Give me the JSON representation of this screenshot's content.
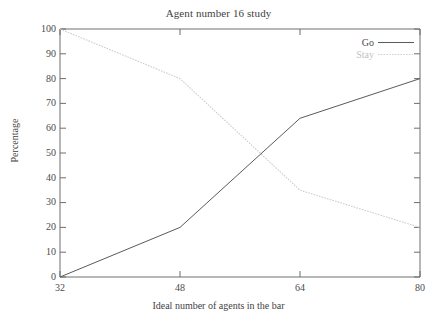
{
  "chart_data": {
    "type": "line",
    "title": "Agent number 16 study",
    "xlabel": "Ideal number of agents in the bar",
    "ylabel": "Percentage",
    "xlim": [
      32,
      80
    ],
    "ylim": [
      0,
      100
    ],
    "xticks": [
      32,
      48,
      64,
      80
    ],
    "yticks": [
      0,
      10,
      20,
      30,
      40,
      50,
      60,
      70,
      80,
      90,
      100
    ],
    "xtick_labels": [
      "32",
      "48",
      "64",
      "80"
    ],
    "ytick_labels": [
      "0",
      "10",
      "20",
      "30",
      "40",
      "50",
      "60",
      "70",
      "80",
      "90",
      "100"
    ],
    "grid": false,
    "legend_position": "top-right",
    "x": [
      32,
      48,
      64,
      80
    ],
    "series": [
      {
        "name": "Go",
        "values": [
          0,
          20,
          64,
          80
        ],
        "color": "#5a5a5a",
        "style": "solid"
      },
      {
        "name": "Stay",
        "values": [
          100,
          80,
          35,
          20
        ],
        "color": "#cccccc",
        "style": "dotted"
      }
    ]
  },
  "legend": {
    "items": [
      {
        "label": "Go"
      },
      {
        "label": "Stay"
      }
    ]
  }
}
